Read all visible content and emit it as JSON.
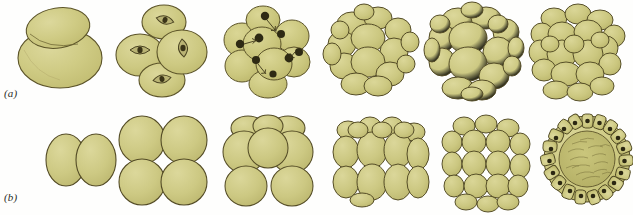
{
  "figure": {
    "background_color": "#fefefd",
    "cell_fill_color": "#ccc87e",
    "cell_fill_light": "#d8d492",
    "cell_outline_color": "#5c5429",
    "nucleus_color": "#2e2a14",
    "stipple_color": "#9c9455",
    "label_color": "#2b2b28"
  },
  "rows": [
    {
      "id": "a",
      "label": "(a)",
      "description": "Cleavage series viewed from the side, unequal blastomeres",
      "stages": [
        {
          "name": "two-cell-stage",
          "cell_count": 2,
          "has_nuclei": false,
          "has_spindles": false
        },
        {
          "name": "four-cell-stage",
          "cell_count": 4,
          "has_nuclei": false,
          "has_spindles": true
        },
        {
          "name": "eight-cell-stage",
          "cell_count": 8,
          "has_nuclei": true,
          "has_spindles": false
        },
        {
          "name": "sixteen-cell-stage",
          "cell_count": 16,
          "has_nuclei": false,
          "has_spindles": false
        },
        {
          "name": "thirty-two-cell-stage",
          "cell_count": 32,
          "has_nuclei": false,
          "has_spindles": false
        },
        {
          "name": "morula-stage",
          "cell_count": 64,
          "has_nuclei": false,
          "has_spindles": false
        }
      ]
    },
    {
      "id": "b",
      "label": "(b)",
      "description": "Cleavage series viewed in regular radial arrangement ending in blastula section",
      "stages": [
        {
          "name": "two-cell-stage",
          "cell_count": 2,
          "has_nuclei": false,
          "has_spindles": false
        },
        {
          "name": "four-cell-stage",
          "cell_count": 4,
          "has_nuclei": false,
          "has_spindles": false
        },
        {
          "name": "eight-cell-stage",
          "cell_count": 8,
          "has_nuclei": false,
          "has_spindles": false
        },
        {
          "name": "sixteen-cell-stage",
          "cell_count": 16,
          "has_nuclei": false,
          "has_spindles": false
        },
        {
          "name": "thirty-two-cell-stage",
          "cell_count": 32,
          "has_nuclei": false,
          "has_spindles": false
        },
        {
          "name": "blastula-section",
          "cell_count": 64,
          "has_nuclei": true,
          "has_spindles": false
        }
      ]
    }
  ]
}
